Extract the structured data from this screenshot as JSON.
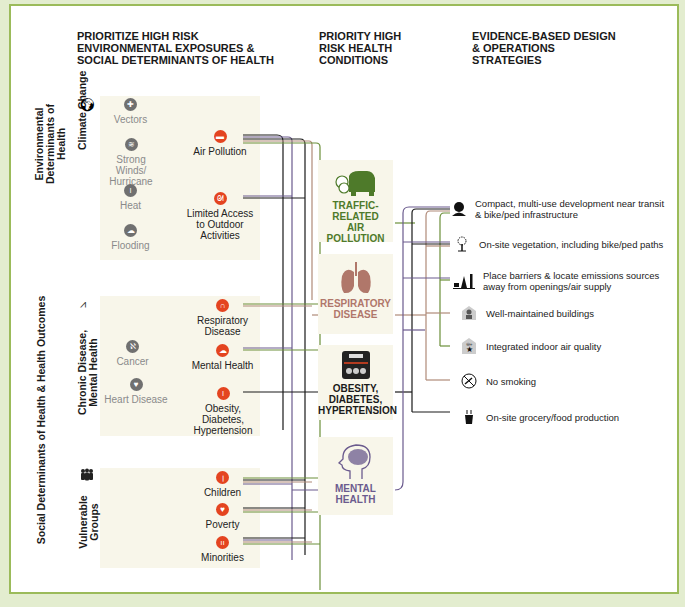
{
  "colors": {
    "background": "#e3edcf",
    "frame_border": "#9bbb5a",
    "panel": "#f8f6ea",
    "hazard_red": "#e44420",
    "neutral_gray": "#707070",
    "traffic_green": "#4e7a2a",
    "respiratory_brown": "#b0776a",
    "mental_purple": "#6b5b8e",
    "line_black": "#1a1a1a",
    "line_purple": "#6b5b8e",
    "line_green": "#6c8f3a",
    "line_brown": "#b08a78"
  },
  "headers": {
    "col1": "Prioritize High Risk Environmental Exposures & Social Determinants of Health",
    "col2": "Priority High Risk Health Conditions",
    "col3": "Evidence-Based Design & Operations Strategies"
  },
  "side_labels": {
    "environmental": "Environmental Determinants of Health",
    "social": "Social Determinants of Health & Health Outcomes"
  },
  "groups": [
    {
      "label": "Climate Change",
      "icon": "globe-icon",
      "gray_items": [
        "Vectors",
        "Strong Winds/ Hurricane",
        "Heat",
        "Flooding"
      ],
      "red_items": [
        "Air Pollution",
        "Limited Access to Outdoor Activities"
      ]
    },
    {
      "label": "Chronic Disease, Mental Health",
      "icon": "heartbeat-icon",
      "gray_items": [
        "Cancer",
        "Heart Disease"
      ],
      "red_items": [
        "Respiratory Disease",
        "Mental Health",
        "Obesity, Diabetes, Hypertension"
      ]
    },
    {
      "label": "Vulnerable Groups",
      "icon": "people-icon",
      "gray_items": [],
      "red_items": [
        "Children",
        "Poverty",
        "Minorities"
      ]
    }
  ],
  "conditions": [
    {
      "label": "Traffic-Related Air Pollution",
      "icon": "car-exhaust-icon",
      "color": "#4e7a2a"
    },
    {
      "label": "Respiratory Disease",
      "icon": "lungs-icon",
      "color": "#b0776a"
    },
    {
      "label": "Obesity, Diabetes, Hypertension",
      "icon": "scale-icon",
      "color": "#1a1a1a"
    },
    {
      "label": "Mental Health",
      "icon": "brain-icon",
      "color": "#6b5b8e"
    }
  ],
  "strategies": [
    {
      "label": "Compact, multi-use development near transit & bike/ped infrastructure",
      "icon": "building-map-icon"
    },
    {
      "label": "On-site vegetation, including bike/ped paths",
      "icon": "tree-icon"
    },
    {
      "label": "Place barriers & locate emissions sources away from openings/air supply",
      "icon": "barrier-tree-icon"
    },
    {
      "label": "Well-maintained buildings",
      "icon": "maintenance-worker-icon"
    },
    {
      "label": "Integrated indoor air quality",
      "icon": "indoor-air-icon"
    },
    {
      "label": "No smoking",
      "icon": "no-smoking-icon"
    },
    {
      "label": "On-site grocery/food production",
      "icon": "plant-pot-icon"
    }
  ]
}
